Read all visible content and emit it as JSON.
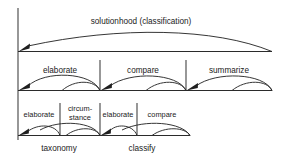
{
  "diagram": {
    "type": "rhetorical-structure-tree",
    "colors": {
      "line": "#3a3a3a",
      "arc": "#2b2b2b",
      "text": "#1a1a1a",
      "background": "#ffffff"
    },
    "levels": [
      {
        "id": "level-1",
        "relations": [
          {
            "id": "rel-solutionhood",
            "label": "solutionhood (classification)"
          }
        ]
      },
      {
        "id": "level-2",
        "relations": [
          {
            "id": "rel-elaborate-1",
            "label": "elaborate"
          },
          {
            "id": "rel-compare-1",
            "label": "compare"
          },
          {
            "id": "rel-summarize",
            "label": "summarize"
          }
        ]
      },
      {
        "id": "level-3",
        "relations": [
          {
            "id": "rel-elaborate-2",
            "label": "elaborate"
          },
          {
            "id": "rel-circumstance",
            "label_line1": "circum-",
            "label_line2": "stance"
          },
          {
            "id": "rel-elaborate-3",
            "label": "elaborate"
          },
          {
            "id": "rel-compare-2",
            "label": "compare"
          }
        ]
      }
    ],
    "leaf_labels": [
      {
        "id": "leaf-taxonomy",
        "label": "taxonomy"
      },
      {
        "id": "leaf-classify",
        "label": "classify"
      }
    ]
  }
}
